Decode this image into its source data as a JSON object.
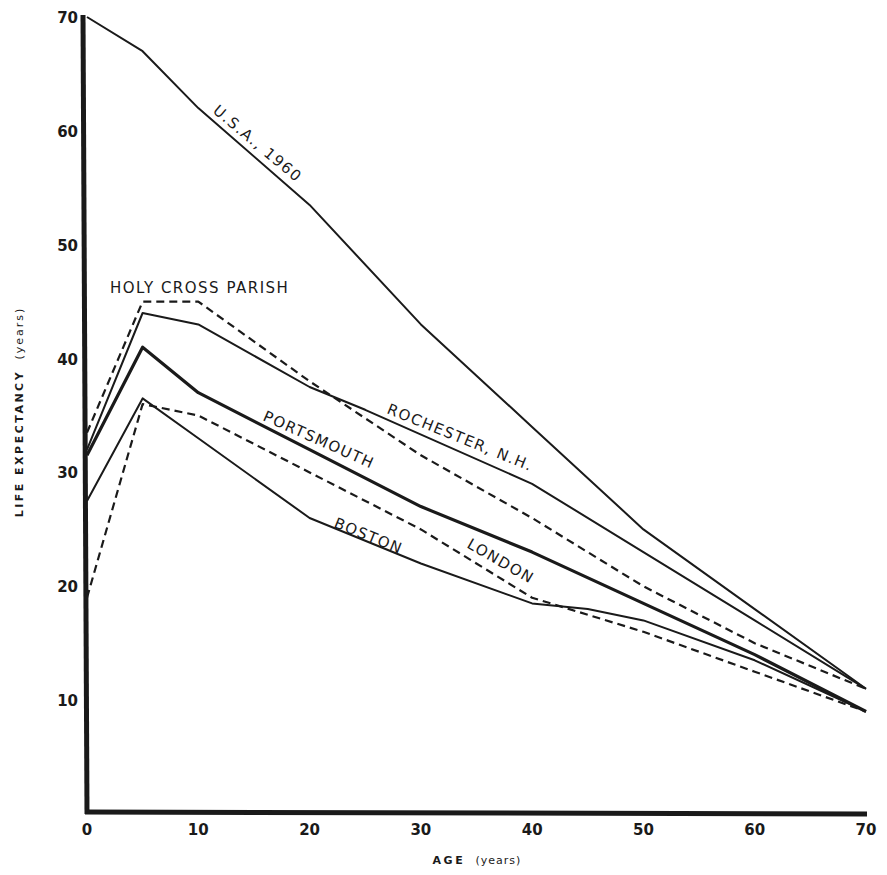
{
  "chart_data": {
    "type": "line",
    "title": "",
    "xlabel": "AGE (years)",
    "ylabel": "LIFE EXPECTANCY (years)",
    "xlim": [
      0,
      70
    ],
    "ylim": [
      0,
      70
    ],
    "x_ticks": [
      "0",
      "10",
      "20",
      "30",
      "40",
      "50",
      "60",
      "70"
    ],
    "y_ticks": [
      "10",
      "20",
      "30",
      "40",
      "50",
      "60",
      "70"
    ],
    "grid": false,
    "legend": "inline labels",
    "series": [
      {
        "name": "U.S.A., 1960",
        "style": "solid",
        "width": 2,
        "x": [
          0,
          5,
          10,
          20,
          30,
          40,
          50,
          60,
          70
        ],
        "values": [
          70,
          67,
          62,
          53.5,
          43,
          34,
          25,
          18,
          11
        ]
      },
      {
        "name": "HOLY CROSS PARISH",
        "style": "dashed",
        "width": 2.2,
        "x": [
          0,
          5,
          10,
          20,
          30,
          40,
          50,
          60,
          70
        ],
        "values": [
          33.5,
          45,
          45,
          38,
          31.5,
          26,
          20,
          15,
          11
        ]
      },
      {
        "name": "ROCHESTER, N.H.",
        "style": "solid",
        "width": 2,
        "x": [
          0,
          5,
          10,
          20,
          25,
          40,
          50,
          60,
          70
        ],
        "values": [
          32,
          44,
          43,
          37.5,
          35.5,
          29,
          23,
          17,
          11
        ]
      },
      {
        "name": "PORTSMOUTH",
        "style": "solid",
        "width": 3.2,
        "x": [
          0,
          5,
          10,
          20,
          30,
          40,
          50,
          60,
          70
        ],
        "values": [
          31.5,
          41,
          37,
          32,
          27,
          23,
          18.5,
          14,
          9
        ]
      },
      {
        "name": "BOSTON",
        "style": "solid",
        "width": 2,
        "x": [
          0,
          5,
          10,
          20,
          30,
          40,
          45,
          50,
          60,
          70
        ],
        "values": [
          27.5,
          36.5,
          33,
          26,
          22,
          18.5,
          18,
          17,
          13.5,
          9
        ]
      },
      {
        "name": "LONDON",
        "style": "dashed",
        "width": 2.2,
        "x": [
          0,
          5,
          10,
          20,
          30,
          40,
          50,
          60,
          70
        ],
        "values": [
          19,
          36,
          35,
          30,
          25,
          19,
          16,
          12.5,
          9
        ]
      }
    ]
  },
  "labels": {
    "x_axis_title": "AGE",
    "x_axis_unit": "(years)",
    "y_axis_title": "LIFE EXPECTANCY",
    "y_axis_unit": "(years)",
    "usa": "U.S.A., 1960",
    "holy_cross": "HOLY CROSS PARISH",
    "rochester": "ROCHESTER, N.H.",
    "portsmouth": "PORTSMOUTH",
    "boston": "BOSTON",
    "london": "LONDON"
  }
}
